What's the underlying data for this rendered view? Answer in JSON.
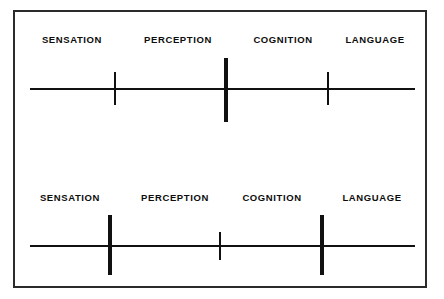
{
  "figure": {
    "border_color": "#2b2b2b",
    "line_color": "#111111",
    "background": "#ffffff"
  },
  "diagrams": [
    {
      "id": "top",
      "name": "continuum-top",
      "axis": {
        "y": 60,
        "thickness": 2,
        "x_start": 30,
        "x_end": 415
      },
      "labels": [
        {
          "text": "SENSATION",
          "x": 72
        },
        {
          "text": "PERCEPTION",
          "x": 178
        },
        {
          "text": "COGNITION",
          "x": 283
        },
        {
          "text": "LANGUAGE",
          "x": 375
        }
      ],
      "ticks": [
        {
          "name": "tick-sensation-perception",
          "x": 115,
          "weight": "minor",
          "top": 44,
          "height": 33
        },
        {
          "name": "tick-perception-cognition",
          "x": 226,
          "weight": "major",
          "top": 30,
          "height": 64
        },
        {
          "name": "tick-cognition-language",
          "x": 328,
          "weight": "minor",
          "top": 44,
          "height": 33
        }
      ]
    },
    {
      "id": "bottom",
      "name": "continuum-bottom",
      "axis": {
        "y": 59,
        "thickness": 2,
        "x_start": 30,
        "x_end": 415
      },
      "labels": [
        {
          "text": "SENSATION",
          "x": 70
        },
        {
          "text": "PERCEPTION",
          "x": 175
        },
        {
          "text": "COGNITION",
          "x": 272
        },
        {
          "text": "LANGUAGE",
          "x": 372
        }
      ],
      "ticks": [
        {
          "name": "tick-sensation-perception",
          "x": 110,
          "weight": "major",
          "top": 29,
          "height": 60
        },
        {
          "name": "tick-perception-cognition",
          "x": 220,
          "weight": "minor",
          "top": 46,
          "height": 28
        },
        {
          "name": "tick-cognition-language",
          "x": 322,
          "weight": "major",
          "top": 29,
          "height": 60
        }
      ]
    }
  ]
}
